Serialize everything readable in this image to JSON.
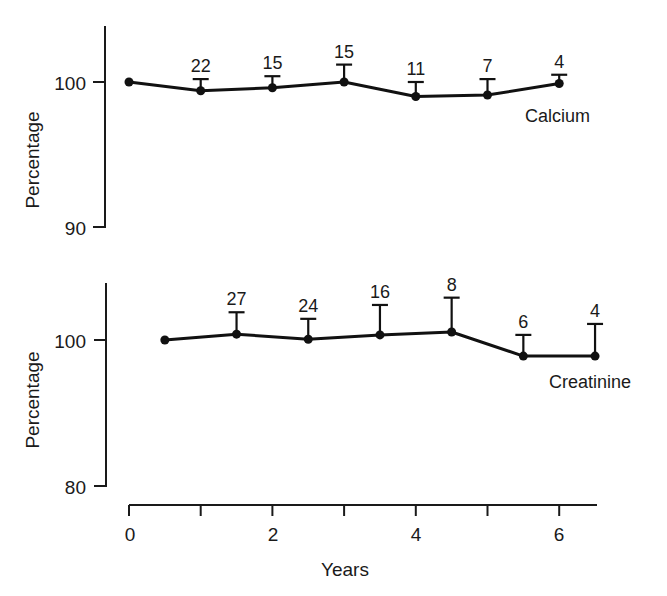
{
  "chart_data": [
    {
      "type": "line",
      "title": "",
      "ylabel": "Percentage",
      "xlabel": "",
      "ylim": [
        89,
        104
      ],
      "yticks": [
        90,
        100
      ],
      "series_label": "Calcium",
      "series": [
        {
          "name": "Calcium",
          "x": [
            0,
            1,
            2,
            3,
            4,
            5,
            6
          ],
          "values": [
            100,
            99.4,
            99.6,
            100,
            99.0,
            99.1,
            99.9
          ],
          "error_upper": [
            null,
            100.2,
            100.4,
            101.2,
            100.0,
            100.2,
            100.5
          ],
          "n_labels": [
            "",
            "22",
            "15",
            "15",
            "11",
            "7",
            "4"
          ]
        }
      ]
    },
    {
      "type": "line",
      "title": "",
      "ylabel": "Percentage",
      "xlabel": "Years",
      "ylim": [
        78,
        108
      ],
      "yticks": [
        80,
        100
      ],
      "xticks": [
        0,
        2,
        4,
        6
      ],
      "xlim": [
        0,
        6.5
      ],
      "series_label": "Creatinine",
      "series": [
        {
          "name": "Creatinine",
          "x": [
            0.5,
            1.5,
            2.5,
            3.5,
            4.5,
            5.5,
            6.5
          ],
          "values": [
            100,
            100.8,
            100.1,
            100.7,
            101.1,
            97.8,
            97.8
          ],
          "error_upper": [
            null,
            103.8,
            102.9,
            104.8,
            105.8,
            100.7,
            102.2
          ],
          "n_labels": [
            "",
            "27",
            "24",
            "16",
            "8",
            "6",
            "4"
          ]
        }
      ]
    }
  ],
  "labels": {
    "top_ylabel": "Percentage",
    "top_ytick_100": "100",
    "top_ytick_90": "90",
    "top_series": "Calcium",
    "bottom_ylabel": "Percentage",
    "bottom_ytick_100": "100",
    "bottom_ytick_80": "80",
    "bottom_series": "Creatinine",
    "xlabel": "Years",
    "xtick_0": "0",
    "xtick_2": "2",
    "xtick_4": "4",
    "xtick_6": "6"
  },
  "geometry": {
    "x0px": 129,
    "pxPerYear": 71.7,
    "top": {
      "y100": 82,
      "pxPerUnit": 14.5
    },
    "bottom": {
      "y100": 340,
      "pxPerUnit": 7.3
    }
  }
}
